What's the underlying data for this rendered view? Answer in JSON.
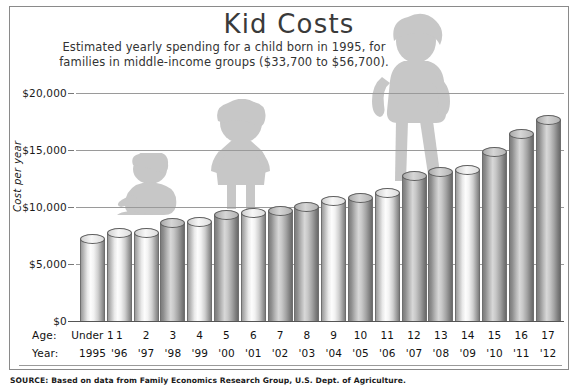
{
  "header": {
    "title": "Kid Costs",
    "subtitle_line1": "Estimated yearly spending for a child born in 1995, for",
    "subtitle_line2": "families in middle-income groups ($33,700 to $56,700)."
  },
  "axes": {
    "y_title": "Cost per year",
    "y_ticks": [
      "$20,000",
      "$15,000",
      "$10,000",
      "$5,000",
      "$0"
    ],
    "row_label_age": "Age:",
    "row_label_year": "Year:"
  },
  "footer": {
    "source": "SOURCE: Based on data from Family Economics Research Group, U.S. Dept. of Agriculture."
  },
  "chart_data": {
    "type": "bar",
    "title": "Kid Costs",
    "subtitle": "Estimated yearly spending for a child born in 1995, for families in middle-income groups ($33,700 to $56,700).",
    "xlabel": "Age / Year",
    "ylabel": "Cost per year",
    "ylim": [
      0,
      20000
    ],
    "ytick_values": [
      0,
      5000,
      10000,
      15000,
      20000
    ],
    "ytick_labels": [
      "$0",
      "$5,000",
      "$10,000",
      "$15,000",
      "$20,000"
    ],
    "grid": true,
    "legend": "none",
    "categories": [
      "Under 1",
      "1",
      "2",
      "3",
      "4",
      "5",
      "6",
      "7",
      "8",
      "9",
      "10",
      "11",
      "12",
      "13",
      "14",
      "15",
      "16",
      "17"
    ],
    "year_labels": [
      "1995",
      "'96",
      "'97",
      "'98",
      "'99",
      "'00",
      "'01",
      "'02",
      "'03",
      "'04",
      "'05",
      "'06",
      "'07",
      "'08",
      "'09",
      "'10",
      "'11",
      "'12"
    ],
    "values": [
      7600,
      8150,
      8200,
      9000,
      9100,
      9700,
      9900,
      10100,
      10400,
      11000,
      11200,
      11700,
      13200,
      13500,
      13700,
      15300,
      16800,
      18100
    ],
    "bar_shades": [
      "light",
      "light",
      "light",
      "dark",
      "light",
      "dark",
      "light",
      "dark",
      "dark",
      "light",
      "dark",
      "light",
      "dark",
      "dark",
      "light",
      "dark",
      "dark",
      "dark"
    ],
    "annotations": [
      {
        "name": "baby-silhouette",
        "label": "crawling baby",
        "near_category": "2"
      },
      {
        "name": "child-silhouette",
        "label": "standing young child",
        "near_category": "5"
      },
      {
        "name": "teen-silhouette",
        "label": "teenager with backpack",
        "near_category": "12"
      }
    ]
  },
  "colors": {
    "frame_border": "#8a8a8a",
    "gridline": "#9a9a9a",
    "text": "#111111",
    "title": "#3a3a3a",
    "silhouette": "#9a9a9a"
  }
}
